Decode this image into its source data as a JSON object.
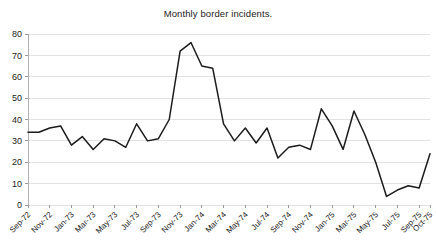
{
  "chart_data": {
    "type": "line",
    "title": "Monthly border incidents.",
    "xlabel": "",
    "ylabel": "",
    "ylim": [
      0,
      80
    ],
    "yticks": [
      0,
      10,
      20,
      30,
      40,
      50,
      60,
      70,
      80
    ],
    "grid": true,
    "legend": false,
    "legend_position": "none",
    "line_color": "#1b1b1b",
    "grid_color": "#e2e2e2",
    "x": [
      "Sep-72",
      "Oct-72",
      "Nov-72",
      "Dec-72",
      "Jan-73",
      "Feb-73",
      "Mar-73",
      "Apr-73",
      "May-73",
      "Jun-73",
      "Jul-73",
      "Aug-73",
      "Sep-73",
      "Oct-73",
      "Nov-73",
      "Dec-73",
      "Jan-74",
      "Feb-74",
      "Mar-74",
      "Apr-74",
      "May-74",
      "Jun-74",
      "Jul-74",
      "Aug-74",
      "Sep-74",
      "Oct-74",
      "Nov-74",
      "Dec-74",
      "Jan-75",
      "Feb-75",
      "Mar-75",
      "Apr-75",
      "May-75",
      "Jun-75",
      "Jul-75",
      "Aug-75",
      "Sep-75",
      "Oct-75"
    ],
    "tick_labels": [
      "Sep-72",
      "Nov-72",
      "Jan-73",
      "Mar-73",
      "May-73",
      "Jul-73",
      "Sep-73",
      "Nov-73",
      "Jan-74",
      "Mar-74",
      "May-74",
      "Jul-74",
      "Sep-74",
      "Nov-74",
      "Jan-75",
      "Mar-75",
      "May-75",
      "Jul-75",
      "Sep-75",
      "Oct-75"
    ],
    "tick_indices": [
      0,
      2,
      4,
      6,
      8,
      10,
      12,
      14,
      16,
      18,
      20,
      22,
      24,
      26,
      28,
      30,
      32,
      34,
      36,
      37
    ],
    "values": [
      34,
      34,
      36,
      37,
      28,
      32,
      26,
      31,
      30,
      27,
      38,
      30,
      31,
      40,
      72,
      76,
      65,
      64,
      38,
      30,
      36,
      29,
      36,
      22,
      27,
      28,
      26,
      45,
      37,
      26,
      44,
      33,
      20,
      4,
      7,
      9,
      8,
      24
    ]
  }
}
